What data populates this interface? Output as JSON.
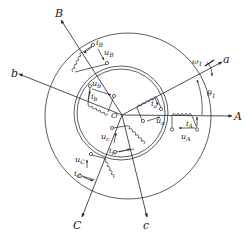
{
  "diagram": {
    "type": "machine-winding-diagram",
    "center_label": "O",
    "stator_axes": [
      {
        "name": "A",
        "label": "A"
      },
      {
        "name": "B",
        "label": "B"
      },
      {
        "name": "C",
        "label": "C"
      }
    ],
    "rotor_axes": [
      {
        "name": "a",
        "label": "a"
      },
      {
        "name": "b",
        "label": "b"
      },
      {
        "name": "c",
        "label": "c"
      }
    ],
    "windings": {
      "A": {
        "current": "i",
        "current_sub": "A",
        "voltage": "u",
        "voltage_sub": "A"
      },
      "B": {
        "current": "i",
        "current_sub": "B",
        "voltage": "u",
        "voltage_sub": "B"
      },
      "C": {
        "current": "i",
        "current_sub": "C",
        "voltage": "u",
        "voltage_sub": "C"
      },
      "a": {
        "current": "i",
        "current_sub": "a",
        "voltage": "u",
        "voltage_sub": "a"
      },
      "b": {
        "current": "i",
        "current_sub": "b",
        "voltage": "u",
        "voltage_sub": "b"
      },
      "c": {
        "current": "i",
        "current_sub": "c",
        "voltage": "u",
        "voltage_sub": "c"
      }
    },
    "angular_speed": {
      "symbol": "ω",
      "sub": "1"
    },
    "angle": {
      "symbol": "θ",
      "sub": "1"
    },
    "colors": {
      "line": "#222222",
      "background": "#ffffff"
    }
  }
}
